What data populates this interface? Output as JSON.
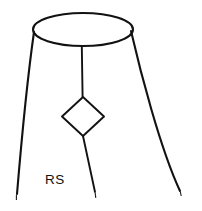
{
  "figure": {
    "title": "",
    "background_color": "#ffffff",
    "stroke_color": "#121212",
    "width": 202,
    "height": 211
  },
  "labels": {
    "rs": {
      "text": "RS",
      "x": 45,
      "y": 184
    }
  },
  "shapes": {
    "top_ellipse": {
      "name": "top-ellipse",
      "cx": 83,
      "cy": 29.5,
      "rx": 50,
      "ry": 16.5
    },
    "diamond": {
      "name": "center-diamond",
      "cx": 83,
      "cy": 116.5,
      "left_x": 62,
      "right_x": 104,
      "top_y": 97,
      "bottom_y": 136,
      "points": "83,97 104,116.5 83,136 62,116.5"
    },
    "stem_upper": {
      "name": "upper-stem-line",
      "from_x": 82,
      "from_y": 46,
      "to_x": 82.5,
      "to_y": 97
    },
    "stem_lower": {
      "name": "lower-stem-line",
      "from_x": 83,
      "from_y": 136,
      "to_x": 95,
      "to_y": 192
    },
    "left_leg": {
      "name": "left-leg-curve",
      "from_x": 34,
      "from_y": 32,
      "to_x": 17,
      "to_y": 194
    },
    "right_leg": {
      "name": "right-leg-curve",
      "from_x": 131,
      "from_y": 31,
      "to_x": 180,
      "to_y": 191
    }
  },
  "end_marks": [
    {
      "name": "left-leg-end-tick",
      "x": 17,
      "y": 196
    },
    {
      "name": "center-leg-end-tick",
      "x": 95,
      "y": 194
    },
    {
      "name": "right-leg-end-tick",
      "x": 180,
      "y": 193
    }
  ]
}
